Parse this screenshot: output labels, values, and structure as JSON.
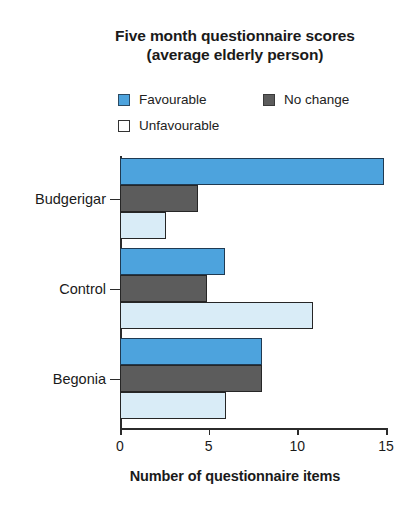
{
  "chart_data": {
    "type": "bar",
    "orientation": "horizontal",
    "title": "Five month questionnaire scores (average elderly person)",
    "title_lines": [
      "Five month questionnaire scores",
      "(average elderly person)"
    ],
    "xlabel": "Number of questionnaire items",
    "ylabel": "",
    "categories": [
      "Budgerigar",
      "Control",
      "Begonia"
    ],
    "series": [
      {
        "name": "Favourable",
        "color": "#4da3dd",
        "values": [
          14.9,
          5.9,
          8.0
        ]
      },
      {
        "name": "No change",
        "color": "#5c5c5c",
        "values": [
          4.4,
          4.9,
          8.0
        ]
      },
      {
        "name": "Unfavourable",
        "color": "#d9ecf7",
        "values": [
          2.6,
          10.9,
          6.0
        ]
      }
    ],
    "xlim": [
      0,
      15
    ],
    "xticks": [
      0,
      5,
      10,
      15
    ],
    "xtick_labels": [
      "0",
      "5",
      "10",
      "15"
    ],
    "grid": false,
    "legend_position": "top"
  },
  "legend": {
    "items": [
      {
        "label": "Favourable",
        "swatch": "favourable-swatch"
      },
      {
        "label": "No change",
        "swatch": "no-change-swatch"
      },
      {
        "label": "Unfavourable",
        "swatch": "unfavourable-swatch"
      }
    ]
  },
  "colors": {
    "favourable": "#4da3dd",
    "no_change": "#5c5c5c",
    "unfavourable": "#d9ecf7",
    "axis": "#2b2b2b",
    "background": "#ffffff"
  }
}
